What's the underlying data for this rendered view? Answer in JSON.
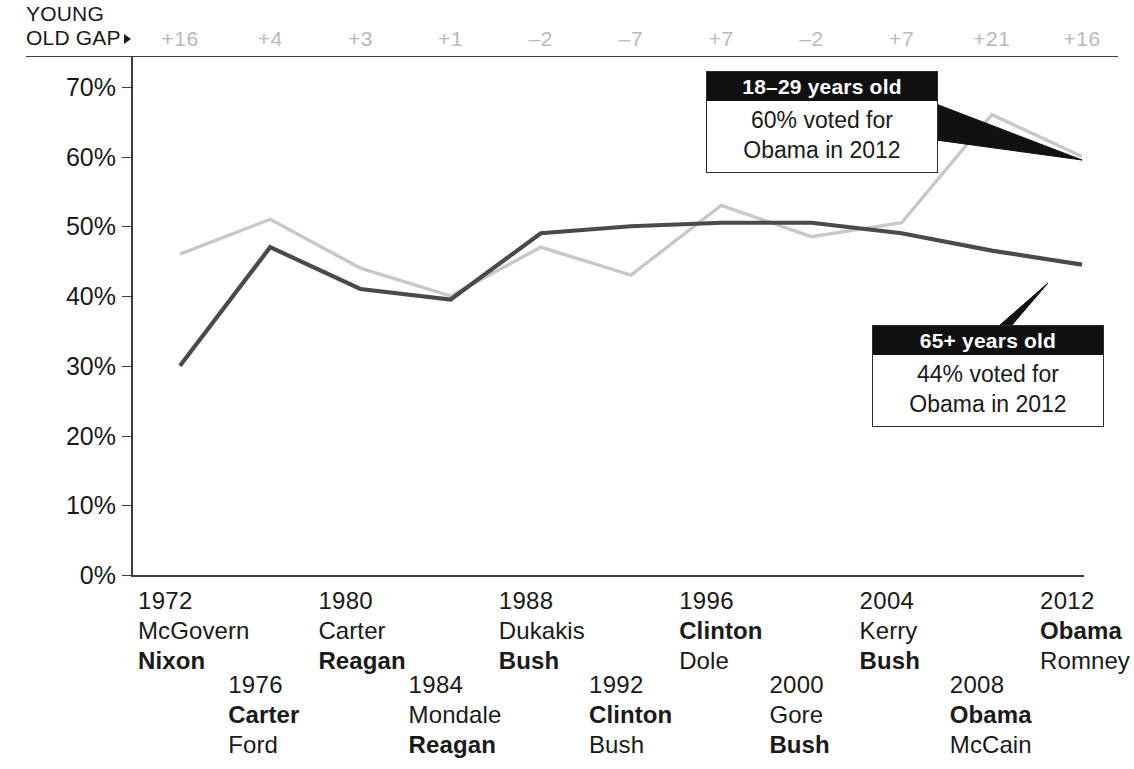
{
  "header": {
    "gap_label_line1": "YOUNG",
    "gap_label_line2": "OLD GAP",
    "arrow_icon": "right-triangle-icon"
  },
  "callouts": [
    {
      "id": "young",
      "title": "18–29 years old",
      "line1": "60% voted for",
      "line2": "Obama in 2012"
    },
    {
      "id": "old",
      "title": "65+ years old",
      "line1": "44% voted for",
      "line2": "Obama in 2012"
    }
  ],
  "colors": {
    "young_line": "#c8c8c8",
    "old_line": "#4a4a4a",
    "axis": "#3b3b3b",
    "gap_text": "#b9b9b9",
    "callout_header_bg": "#101010",
    "text": "#1a1a1a"
  },
  "chart_data": {
    "type": "line",
    "title": "",
    "xlabel": "",
    "ylabel": "",
    "ylim": [
      0,
      70
    ],
    "yticks": [
      0,
      10,
      20,
      30,
      40,
      50,
      60,
      70
    ],
    "ytick_labels": [
      "0%",
      "10%",
      "20%",
      "30%",
      "40%",
      "50%",
      "60%",
      "70%"
    ],
    "grid": false,
    "legend": "callout-annotations",
    "x": [
      1972,
      1976,
      1980,
      1984,
      1988,
      1992,
      1996,
      2000,
      2004,
      2008,
      2012
    ],
    "categories": [
      "1972",
      "1976",
      "1980",
      "1984",
      "1988",
      "1992",
      "1996",
      "2000",
      "2004",
      "2008",
      "2012"
    ],
    "series": [
      {
        "name": "18–29 years old",
        "color": "#c8c8c8",
        "values": [
          46,
          51,
          44,
          40,
          47,
          43,
          53,
          48.5,
          50.5,
          66,
          60
        ]
      },
      {
        "name": "65+ years old",
        "color": "#4a4a4a",
        "values": [
          30,
          47,
          41,
          39.5,
          49,
          50,
          50.5,
          50.5,
          49,
          46.5,
          44.5
        ]
      }
    ],
    "gap_row_label": "YOUNG OLD GAP",
    "gap_values": [
      "+16",
      "+4",
      "+3",
      "+1",
      "–2",
      "–7",
      "+7",
      "–2",
      "+7",
      "+21",
      "+16"
    ],
    "elections": [
      {
        "year": "1972",
        "row": "top",
        "candidates": [
          {
            "name": "McGovern",
            "winner": false
          },
          {
            "name": "Nixon",
            "winner": true
          }
        ]
      },
      {
        "year": "1976",
        "row": "bottom",
        "candidates": [
          {
            "name": "Carter",
            "winner": true
          },
          {
            "name": "Ford",
            "winner": false
          }
        ]
      },
      {
        "year": "1980",
        "row": "top",
        "candidates": [
          {
            "name": "Carter",
            "winner": false
          },
          {
            "name": "Reagan",
            "winner": true
          }
        ]
      },
      {
        "year": "1984",
        "row": "bottom",
        "candidates": [
          {
            "name": "Mondale",
            "winner": false
          },
          {
            "name": "Reagan",
            "winner": true
          }
        ]
      },
      {
        "year": "1988",
        "row": "top",
        "candidates": [
          {
            "name": "Dukakis",
            "winner": false
          },
          {
            "name": "Bush",
            "winner": true
          }
        ]
      },
      {
        "year": "1992",
        "row": "bottom",
        "candidates": [
          {
            "name": "Clinton",
            "winner": true
          },
          {
            "name": "Bush",
            "winner": false
          }
        ]
      },
      {
        "year": "1996",
        "row": "top",
        "candidates": [
          {
            "name": "Clinton",
            "winner": true
          },
          {
            "name": "Dole",
            "winner": false
          }
        ]
      },
      {
        "year": "2000",
        "row": "bottom",
        "candidates": [
          {
            "name": "Gore",
            "winner": false
          },
          {
            "name": "Bush",
            "winner": true
          }
        ]
      },
      {
        "year": "2004",
        "row": "top",
        "candidates": [
          {
            "name": "Kerry",
            "winner": false
          },
          {
            "name": "Bush",
            "winner": true
          }
        ]
      },
      {
        "year": "2008",
        "row": "bottom",
        "candidates": [
          {
            "name": "Obama",
            "winner": true
          },
          {
            "name": "McCain",
            "winner": false
          }
        ]
      },
      {
        "year": "2012",
        "row": "top",
        "candidates": [
          {
            "name": "Obama",
            "winner": true
          },
          {
            "name": "Romney",
            "winner": false
          }
        ]
      }
    ]
  }
}
